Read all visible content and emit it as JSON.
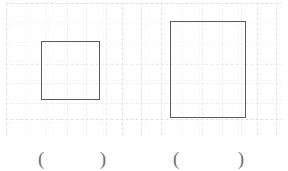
{
  "page": {
    "background_color": "#ffffff",
    "width": 288,
    "height": 171
  },
  "grid": {
    "name": "dotted-graph-paper",
    "line_color": "#e2e2e9",
    "cell_size_px": 19.3,
    "columns": 14,
    "rows": 7,
    "left_px": 6,
    "top_px": 3,
    "width_px": 276,
    "height_px": 133
  },
  "figures": [
    {
      "id": "square",
      "shape": "square",
      "stroke_color": "#595963",
      "stroke_width_px": 1.2,
      "x_px": 41,
      "y_px": 41,
      "width_px": 59,
      "height_px": 59,
      "width_cells": 3,
      "height_cells": 3,
      "area_cells": 9
    },
    {
      "id": "rectangle",
      "shape": "rectangle",
      "stroke_color": "#595963",
      "stroke_width_px": 1.2,
      "x_px": 170,
      "y_px": 21,
      "width_px": 76,
      "height_px": 97,
      "width_cells": 4,
      "height_cells": 5,
      "area_cells": 20
    }
  ],
  "answer_blanks": [
    {
      "id": "blank-square",
      "open_paren": "(",
      "value": "",
      "close_paren": ")"
    },
    {
      "id": "blank-rectangle",
      "open_paren": "(",
      "value": "",
      "close_paren": ")"
    }
  ]
}
